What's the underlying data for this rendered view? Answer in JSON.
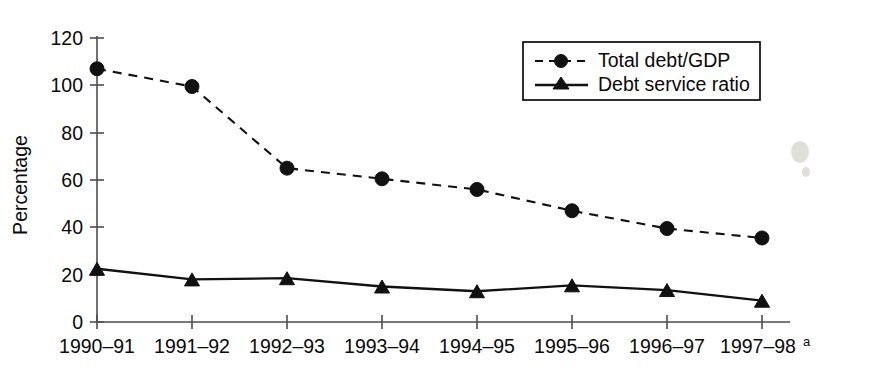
{
  "chart_data": {
    "type": "line",
    "title": "",
    "subtitle": "",
    "xlabel": "",
    "ylabel": "Percentage",
    "categories": [
      "1990–91",
      "1991–92",
      "1992–93",
      "1993–94",
      "1994–95",
      "1995–96",
      "1996–97",
      "1997–98"
    ],
    "category_superscripts": [
      "",
      "",
      "",
      "",
      "",
      "",
      "",
      "a"
    ],
    "series": [
      {
        "name": "Total debt/GDP",
        "marker": "circle",
        "line_style": "dashed",
        "color": "#111111",
        "values": [
          107,
          99.5,
          65,
          60.5,
          56,
          47,
          39.5,
          35.5
        ]
      },
      {
        "name": "Debt service ratio",
        "marker": "triangle",
        "line_style": "solid",
        "color": "#111111",
        "values": [
          22.5,
          18,
          18.5,
          15,
          13,
          15.5,
          13.5,
          9
        ]
      }
    ],
    "ylim": [
      0,
      120
    ],
    "yticks": [
      0,
      20,
      40,
      60,
      80,
      100,
      120
    ],
    "ytick_labels": [
      "0",
      "20",
      "40",
      "60",
      "80",
      "100",
      "120"
    ],
    "grid": false,
    "legend_position": "top-right",
    "legend_entries": [
      "Total debt/GDP",
      "Debt service ratio"
    ]
  },
  "legend": {
    "items": [
      {
        "label": "Total debt/GDP",
        "style": "dashed-circle"
      },
      {
        "label": "Debt service ratio",
        "style": "solid-triangle"
      }
    ]
  },
  "axes": {
    "y_title": "Percentage",
    "y_ticks": [
      "120",
      "100",
      "80",
      "60",
      "40",
      "20",
      "0"
    ],
    "x_ticks": [
      "1990–91",
      "1991–92",
      "1992–93",
      "1993–94",
      "1994–95",
      "1995–96",
      "1996–97",
      "1997–98"
    ],
    "x_last_superscript": "a"
  }
}
